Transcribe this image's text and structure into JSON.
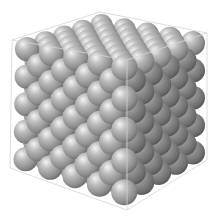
{
  "figure": {
    "structure": "face-centered cubic",
    "unit_cells_per_axis": 4,
    "sphere_color": "#9e9e9e",
    "sphere_highlight": "#f2f2f2",
    "sphere_shadow": "#4a4a4a",
    "box_edge_color": "#d4d4d4",
    "background": "#ffffff"
  }
}
